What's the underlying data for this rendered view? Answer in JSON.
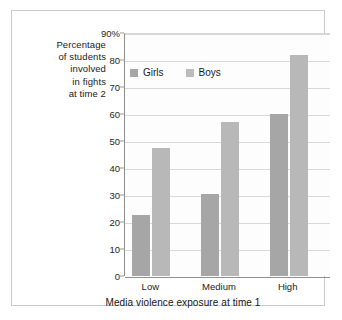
{
  "figure": {
    "border_color": "#c9c9c9",
    "background": "#ffffff"
  },
  "chart_data": {
    "type": "bar",
    "title": "",
    "categories": [
      "Low",
      "Medium",
      "High"
    ],
    "series": [
      {
        "name": "Girls",
        "color": "#a6a6a6",
        "values": [
          22.5,
          30.5,
          60
        ]
      },
      {
        "name": "Boys",
        "color": "#b8b8b8",
        "values": [
          47.5,
          57,
          82
        ]
      }
    ],
    "xlabel": "Media violence exposure at time 1",
    "ylabel": "Percentage of students involved in fights at time 2",
    "ylim": [
      0,
      90
    ],
    "yticks": [
      0,
      10,
      20,
      30,
      40,
      50,
      60,
      70,
      80,
      90
    ],
    "ytick_labels": [
      "0",
      "10",
      "20",
      "30",
      "40",
      "50",
      "60",
      "70",
      "80",
      "90%"
    ],
    "grid": true,
    "legend_position": "top-left-inside"
  },
  "y_axis_caption_lines": [
    "Percentage",
    "of students",
    "involved",
    "in fights",
    "at time 2"
  ],
  "legend": {
    "entries": [
      {
        "label": "Girls",
        "color": "#a6a6a6"
      },
      {
        "label": "Boys",
        "color": "#bcbcbc"
      }
    ]
  }
}
